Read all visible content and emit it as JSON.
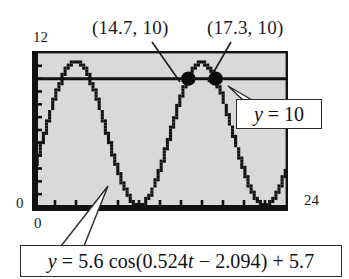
{
  "figure": {
    "kind": "graphing-calculator-plot",
    "background": "#ffffff",
    "plot_fill": "#d9d9d9",
    "frame_color": "#121212",
    "curve_color": "#111111",
    "axes": {
      "y_max_label": "12",
      "y_min_label": "0",
      "x_min_label": "0",
      "x_max_label": "24"
    },
    "annotations": {
      "point_1": "(14.7, 10)",
      "point_2": "(17.3, 10)",
      "line_callout": "y = 10",
      "equation_callout": {
        "lead": "y",
        "body": " = 5.6 cos(0.524",
        "var": "t",
        "tail": " − 2.094) + 5.7"
      }
    }
  },
  "chart_data": {
    "type": "line",
    "title": "",
    "xlabel": "",
    "ylabel": "",
    "xlim": [
      0,
      24
    ],
    "ylim": [
      0,
      12
    ],
    "grid": false,
    "legend": "none",
    "series": [
      {
        "name": "y = 5.6 cos(0.524t - 2.094) + 5.7",
        "expression": "5.6*cos(0.524*t - 2.094) + 5.7",
        "amplitude": 5.6,
        "angular_frequency": 0.524,
        "phase": 2.094,
        "vertical_shift": 5.7,
        "style": "pixelated-dotted"
      },
      {
        "name": "y = 10",
        "expression": "10",
        "style": "solid-horizontal",
        "value": 10
      }
    ],
    "intersections": [
      {
        "label": "(14.7, 10)",
        "x": 14.7,
        "y": 10
      },
      {
        "label": "(17.3, 10)",
        "x": 17.3,
        "y": 10
      }
    ],
    "xticks": [
      2,
      4,
      6,
      8,
      10,
      12,
      14,
      16,
      18,
      20,
      22
    ],
    "yticks": [
      1,
      2,
      3,
      4,
      5,
      6,
      7,
      8,
      9,
      10,
      11
    ]
  }
}
